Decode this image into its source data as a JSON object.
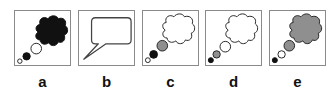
{
  "colors": {
    "black": "#111111",
    "gray": "#8f8f8f",
    "white": "#ffffff",
    "stroke": "#222222",
    "border": "#8a8a8a"
  },
  "panels": [
    {
      "label": "a",
      "type": "thought",
      "cloud_fill": "black",
      "bubbles": [
        {
          "size": "large",
          "fill": "white"
        },
        {
          "size": "medium",
          "fill": "black"
        },
        {
          "size": "small",
          "fill": "white"
        }
      ]
    },
    {
      "label": "b",
      "type": "speech",
      "cloud_fill": "white",
      "bubbles": []
    },
    {
      "label": "c",
      "type": "thought",
      "cloud_fill": "white",
      "bubbles": [
        {
          "size": "large",
          "fill": "gray"
        },
        {
          "size": "medium",
          "fill": "black"
        },
        {
          "size": "small",
          "fill": "white"
        }
      ]
    },
    {
      "label": "d",
      "type": "thought",
      "cloud_fill": "white",
      "bubbles": [
        {
          "size": "large",
          "fill": "white"
        },
        {
          "size": "medium",
          "fill": "gray"
        },
        {
          "size": "small",
          "fill": "black"
        }
      ]
    },
    {
      "label": "e",
      "type": "thought",
      "cloud_fill": "gray",
      "bubbles": [
        {
          "size": "large",
          "fill": "gray"
        },
        {
          "size": "medium",
          "fill": "white"
        },
        {
          "size": "small",
          "fill": "black"
        }
      ]
    }
  ]
}
